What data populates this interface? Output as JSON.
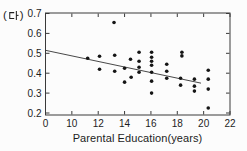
{
  "figure": {
    "panel_label": "(다)",
    "paren_open": "(",
    "paren_close": ")"
  },
  "chart_data": {
    "type": "scatter",
    "title": "",
    "xlabel": "Parental Education(years)",
    "ylabel": "",
    "x_ticks": [
      0,
      10,
      12,
      14,
      16,
      18,
      20,
      22
    ],
    "y_ticks": [
      0.2,
      0.3,
      0.4,
      0.5,
      0.6,
      0.7
    ],
    "xlim_note": "axis compressed between 0 and 10; ticks evenly spaced",
    "ylim": [
      0.2,
      0.7
    ],
    "grid": false,
    "frame_color": "#3a3a3a",
    "point_color": "#151515",
    "trend_color": "#333333",
    "points": [
      [
        11.2,
        0.475
      ],
      [
        12.1,
        0.485
      ],
      [
        12.1,
        0.42
      ],
      [
        13.2,
        0.655
      ],
      [
        13.25,
        0.49
      ],
      [
        13.25,
        0.41
      ],
      [
        14.0,
        0.425
      ],
      [
        14.0,
        0.355
      ],
      [
        14.45,
        0.47
      ],
      [
        14.5,
        0.38
      ],
      [
        15.1,
        0.505
      ],
      [
        15.1,
        0.46
      ],
      [
        15.1,
        0.43
      ],
      [
        15.1,
        0.405
      ],
      [
        16.05,
        0.505
      ],
      [
        16.05,
        0.48
      ],
      [
        16.05,
        0.46
      ],
      [
        16.05,
        0.44
      ],
      [
        16.05,
        0.405
      ],
      [
        16.05,
        0.36
      ],
      [
        16.05,
        0.3
      ],
      [
        17.2,
        0.445
      ],
      [
        17.2,
        0.41
      ],
      [
        17.2,
        0.375
      ],
      [
        18.35,
        0.505
      ],
      [
        18.35,
        0.487
      ],
      [
        18.25,
        0.375
      ],
      [
        18.25,
        0.34
      ],
      [
        19.3,
        0.37
      ],
      [
        19.3,
        0.335
      ],
      [
        19.3,
        0.31
      ],
      [
        20.35,
        0.415
      ],
      [
        20.35,
        0.37
      ],
      [
        20.35,
        0.32
      ],
      [
        20.35,
        0.225
      ]
    ],
    "trend_line": {
      "x_start": 0,
      "y_start": 0.515,
      "x_end": 19.8,
      "y_end": 0.35
    }
  }
}
